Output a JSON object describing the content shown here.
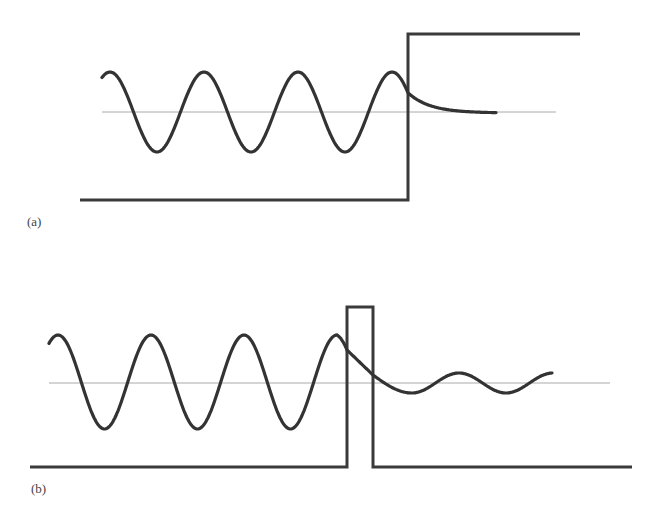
{
  "panels": [
    {
      "id": "a",
      "label": "(a)",
      "description": "Wave incident on a potential step",
      "barrier_type": "step",
      "axis": {
        "x1": 102,
        "x2": 556,
        "y": 112
      },
      "potential": {
        "baseline_x1": 80,
        "step_x": 408,
        "baseline_y": 200,
        "top_y": 34,
        "top_x2": 580
      },
      "wave": {
        "incident": {
          "x_start": 102,
          "x_end": 408,
          "amplitude": 40,
          "period": 94,
          "first_peak_x": 110,
          "center_y": 112
        },
        "transmitted": {
          "type": "exponential-decay",
          "x_start": 408,
          "x_end": 496,
          "end_y": 113
        }
      }
    },
    {
      "id": "b",
      "label": "(b)",
      "description": "Wave tunneling through a finite barrier",
      "barrier_type": "rectangular-barrier",
      "axis": {
        "x1": 49,
        "x2": 610,
        "y": 383
      },
      "potential": {
        "baseline_x1": 30,
        "baseline_x2": 632,
        "baseline_y": 467,
        "barrier_left_x": 347,
        "barrier_right_x": 373,
        "barrier_top_y": 307
      },
      "wave": {
        "incident": {
          "x_start": 49,
          "x_end": 347,
          "amplitude": 47,
          "period": 93,
          "first_peak_x": 58,
          "center_y": 382
        },
        "inside_barrier": {
          "x_start": 347,
          "x_end": 373,
          "y_start": 350,
          "y_end": 375
        },
        "transmitted": {
          "x_start": 373,
          "x_end": 552,
          "amplitude": 10,
          "period": 94,
          "first_trough_x": 412,
          "center_y": 383
        }
      }
    }
  ],
  "colors": {
    "background": "#ffffff",
    "wave": "#333333",
    "potential": "#3a3a3a",
    "axis": "#aaaaaa",
    "label": "#444444"
  }
}
